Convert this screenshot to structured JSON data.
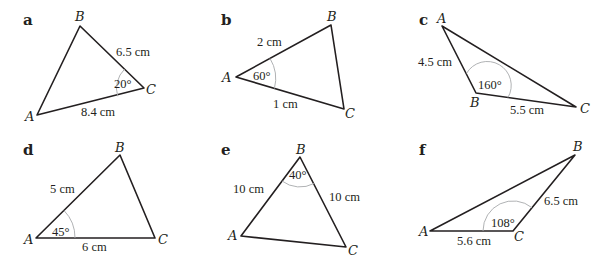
{
  "diagrams": [
    {
      "tag": "a",
      "vertices": {
        "A": "A",
        "B": "B",
        "C": "C"
      },
      "sides": {
        "BC": "6.5 cm",
        "AC": "8.4 cm"
      },
      "angle": {
        "at": "C",
        "label": "20°"
      }
    },
    {
      "tag": "b",
      "vertices": {
        "A": "A",
        "B": "B",
        "C": "C"
      },
      "sides": {
        "AB": "2 cm",
        "AC": "1 cm"
      },
      "angle": {
        "at": "A",
        "label": "60°"
      }
    },
    {
      "tag": "c",
      "vertices": {
        "A": "A",
        "B": "B",
        "C": "C"
      },
      "sides": {
        "AB": "4.5 cm",
        "BC": "5.5 cm"
      },
      "angle": {
        "at": "B",
        "label": "160°"
      }
    },
    {
      "tag": "d",
      "vertices": {
        "A": "A",
        "B": "B",
        "C": "C"
      },
      "sides": {
        "AB": "5 cm",
        "AC": "6 cm"
      },
      "angle": {
        "at": "A",
        "label": "45°"
      }
    },
    {
      "tag": "e",
      "vertices": {
        "A": "A",
        "B": "B",
        "C": "C"
      },
      "sides": {
        "AB": "10 cm",
        "BC": "10 cm"
      },
      "angle": {
        "at": "B",
        "label": "40°"
      }
    },
    {
      "tag": "f",
      "vertices": {
        "A": "A",
        "B": "B",
        "C": "C"
      },
      "sides": {
        "AC": "5.6 cm",
        "BC": "6.5 cm"
      },
      "angle": {
        "at": "C",
        "label": "108°"
      }
    }
  ]
}
